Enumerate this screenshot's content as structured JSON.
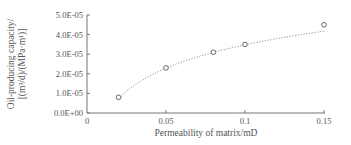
{
  "chart_data": {
    "type": "scatter",
    "title": "",
    "xlabel": "Permeability of matrix/mD",
    "ylabel_line1": "Oil-producing capacity/",
    "ylabel_line2": "[(m³/d)/(MPa·m¹)]",
    "x_ticks": [
      "0",
      "0.05",
      "0.1",
      "0.15"
    ],
    "y_ticks": [
      "0.0E+00",
      "1.0E-05",
      "2.0E-05",
      "3.0E-05",
      "4.0E-05",
      "5.0E-05"
    ],
    "xlim": [
      0,
      0.15
    ],
    "ylim": [
      0,
      5e-05
    ],
    "grid": false,
    "legend": null,
    "series": [
      {
        "name": "Oil-producing capacity",
        "marker": "open-circle",
        "x": [
          0.02,
          0.05,
          0.08,
          0.1,
          0.15
        ],
        "y": [
          8e-06,
          2.3e-05,
          3.1e-05,
          3.5e-05,
          4.5e-05
        ]
      },
      {
        "name": "Fitted trend",
        "style": "dotted-line",
        "type": "line",
        "x": [
          0.02,
          0.05,
          0.08,
          0.1,
          0.15
        ],
        "y": [
          8e-06,
          2.2e-05,
          3e-05,
          3.45e-05,
          4.3e-05
        ]
      }
    ]
  }
}
